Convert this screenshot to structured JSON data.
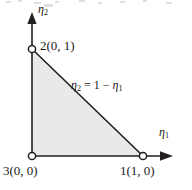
{
  "figure": {
    "name": "unit-reference-triangle",
    "caption_text": "",
    "background_color": "#ffffff",
    "fill_color": "#e9e9e9",
    "line_color": "#231f20",
    "marker_fill": "#ffffff",
    "width": 192,
    "height": 190
  },
  "axes": {
    "x": {
      "label_main": "η",
      "label_sub": "1",
      "arrow": "arrow-right"
    },
    "y": {
      "label_main": "η",
      "label_sub": "2",
      "arrow": "arrow-up"
    }
  },
  "vertices": [
    {
      "id": "node-2",
      "label_number": "2",
      "label_coords": "(0, 1)",
      "label_full": "2(0, 1)",
      "x": 0,
      "y": 1,
      "marker": "open-circle"
    },
    {
      "id": "node-3",
      "label_number": "3",
      "label_coords": "(0, 0)",
      "label_full": "3(0, 0)",
      "x": 0,
      "y": 0,
      "marker": "open-circle"
    },
    {
      "id": "node-1",
      "label_number": "1",
      "label_coords": "(1, 0)",
      "label_full": "1(1, 0)",
      "x": 1,
      "y": 0,
      "marker": "open-circle"
    }
  ],
  "edge_equation": {
    "lhs_main": "η",
    "lhs_sub": "2",
    "operator": "=",
    "rhs_constant": "1",
    "rhs_minus": "−",
    "rhs_main": "η",
    "rhs_sub": "1",
    "full": "η₂ = 1 − η₁"
  }
}
